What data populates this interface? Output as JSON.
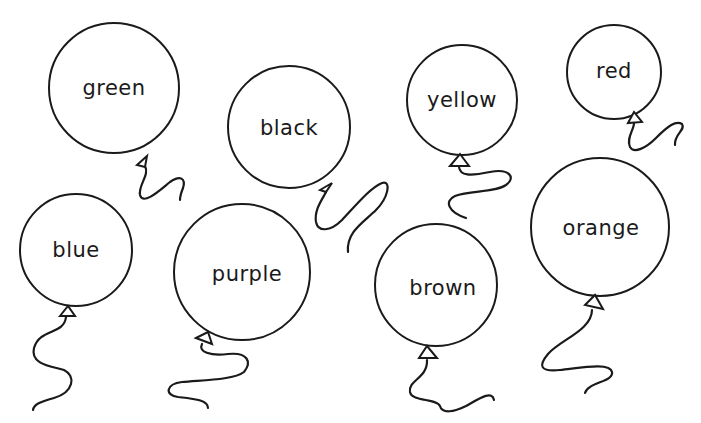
{
  "worksheet": {
    "background": "#ffffff",
    "ink_color": "#1a1a1a",
    "balloons": [
      {
        "label": "green",
        "cx": 114,
        "cy": 88,
        "r": 65,
        "knot": "137,165 147,156 145,167",
        "string": "M145,166 C150,175 138,185 140,195 C143,206 160,190 170,182 C180,175 186,178 183,188 C181,193 180,198 180,200"
      },
      {
        "label": "black",
        "cx": 289,
        "cy": 127,
        "r": 61,
        "knot": "320,190 332,183 326,192",
        "string": "M326,192 C322,200 314,210 316,222 C318,232 330,232 342,220 C356,205 370,188 382,183 C392,180 388,198 376,210 C364,222 346,232 348,252"
      },
      {
        "label": "yellow",
        "cx": 462,
        "cy": 100,
        "r": 55,
        "knot": "450,166 460,154 469,166",
        "string": "M459,167 C460,176 470,176 490,172 C510,168 516,178 506,185 C494,193 470,190 455,196 C444,201 448,212 466,218"
      },
      {
        "label": "red",
        "cx": 614,
        "cy": 72,
        "r": 47,
        "knot": "628,123 634,112 642,122",
        "string": "M634,123 C634,130 626,138 630,147 C634,154 646,148 656,138 C668,126 676,120 682,124 C686,130 674,134 675,145"
      },
      {
        "label": "blue",
        "cx": 76,
        "cy": 250,
        "r": 56,
        "knot": "60,316 68,306 75,316",
        "string": "M66,317 C64,335 40,328 34,348 C30,364 50,366 64,370 C76,376 74,392 54,398 C40,402 34,404 33,410"
      },
      {
        "label": "purple",
        "cx": 242,
        "cy": 272,
        "r": 68,
        "knot": "196,338 208,332 212,344",
        "string": "M202,344 C198,352 210,356 228,354 C248,352 252,362 244,372 C234,380 202,380 182,382 C166,384 164,395 178,397 C196,399 208,400 208,408"
      },
      {
        "label": "brown",
        "cx": 436,
        "cy": 285,
        "r": 61,
        "knot": "419,358 427,346 437,358",
        "string": "M427,360 C428,378 408,380 410,392 C412,402 436,398 440,406 C442,414 454,412 466,406 C480,398 492,390 494,400"
      },
      {
        "label": "orange",
        "cx": 600,
        "cy": 227,
        "r": 69,
        "knot": "585,305 595,295 603,309",
        "string": "M592,310 C592,330 560,340 548,354 C538,366 540,372 560,370 C580,368 610,362 612,372 C614,382 588,382 585,393"
      }
    ]
  }
}
